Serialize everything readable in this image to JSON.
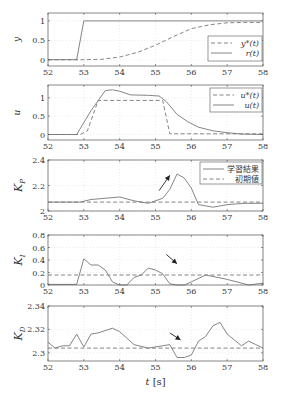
{
  "figure": {
    "xlabel": "t [s]",
    "x_ticks": [
      52,
      53,
      54,
      55,
      56,
      57,
      58
    ],
    "colors": {
      "line": "#777777",
      "axis": "#555555",
      "grid": "#d8d8d8",
      "text": "#333333"
    }
  },
  "chart_data": [
    {
      "type": "line",
      "ylabel": "y",
      "xlim": [
        52,
        58
      ],
      "ylim": [
        -0.15,
        1.2
      ],
      "yticks": [
        0,
        0.5,
        1
      ],
      "ytick_labels": [
        "0",
        "0.5",
        "1"
      ],
      "grid": true,
      "legend": {
        "position": "lower right",
        "entries": [
          "y*(t)",
          "r(t)"
        ]
      },
      "series": [
        {
          "name": "y*(t)",
          "style": "dashed",
          "x": [
            52,
            53,
            53.5,
            54,
            54.5,
            55,
            55.5,
            56,
            56.5,
            57,
            57.5,
            58
          ],
          "y": [
            0.01,
            0.01,
            0.02,
            0.08,
            0.2,
            0.38,
            0.6,
            0.8,
            0.9,
            0.95,
            0.96,
            0.96
          ]
        },
        {
          "name": "r(t)",
          "style": "solid",
          "x": [
            52,
            52.8,
            53,
            58
          ],
          "y": [
            0.01,
            0.01,
            1.0,
            1.0
          ]
        }
      ]
    },
    {
      "type": "line",
      "ylabel": "u",
      "xlim": [
        52,
        58
      ],
      "ylim": [
        -0.15,
        1.35
      ],
      "yticks": [
        0,
        0.5,
        1
      ],
      "ytick_labels": [
        "0",
        "0.5",
        "1"
      ],
      "grid": true,
      "legend": {
        "position": "upper right",
        "entries": [
          "u*(t)",
          "u(t)"
        ]
      },
      "series": [
        {
          "name": "u*(t)",
          "style": "dashed",
          "x": [
            52,
            52.9,
            53.1,
            53.4,
            55.2,
            55.4,
            58
          ],
          "y": [
            0,
            0,
            0.1,
            0.93,
            0.93,
            0.02,
            0.02
          ]
        },
        {
          "name": "u(t)",
          "style": "solid",
          "x": [
            52,
            52.8,
            53.2,
            53.6,
            53.8,
            54.0,
            54.3,
            54.8,
            55.1,
            55.3,
            55.6,
            55.9,
            56.2,
            56.6,
            57.0,
            57.4,
            58
          ],
          "y": [
            0,
            0,
            0.65,
            1.2,
            1.22,
            1.18,
            1.08,
            1.07,
            1.05,
            0.9,
            0.55,
            0.35,
            0.2,
            0.1,
            0.05,
            0.01,
            0.0
          ]
        }
      ]
    },
    {
      "type": "line",
      "ylabel": "KP",
      "xlim": [
        52,
        58
      ],
      "ylim": [
        2,
        2.4
      ],
      "yticks": [
        2,
        2.2,
        2.4
      ],
      "ytick_labels": [
        "2",
        "2.2",
        "2.4"
      ],
      "grid": true,
      "legend": {
        "position": "upper right",
        "entries": [
          "学習結果",
          "初期値"
        ]
      },
      "annotation": {
        "type": "arrow",
        "direction": "up-right",
        "x_from": 55.1,
        "y_from": 2.16,
        "x_to": 55.4,
        "y_to": 2.28
      },
      "series": [
        {
          "name": "学習結果",
          "style": "solid",
          "x": [
            52,
            52.9,
            53.2,
            54.0,
            54.4,
            54.8,
            55.2,
            55.4,
            55.6,
            55.8,
            56.0,
            56.2,
            56.6,
            57.0,
            57.5,
            58
          ],
          "y": [
            2.07,
            2.07,
            2.09,
            2.11,
            2.08,
            2.06,
            2.1,
            2.17,
            2.29,
            2.26,
            2.18,
            2.05,
            2.03,
            2.05,
            2.06,
            2.06
          ]
        },
        {
          "name": "初期値",
          "style": "dashed",
          "x": [
            52,
            58
          ],
          "y": [
            2.07,
            2.07
          ]
        }
      ]
    },
    {
      "type": "line",
      "ylabel": "KI",
      "xlim": [
        52,
        58
      ],
      "ylim": [
        0,
        0.8
      ],
      "yticks": [
        0,
        0.2,
        0.4,
        0.6,
        0.8
      ],
      "ytick_labels": [
        "0",
        "0.2",
        "0.4",
        "0.6",
        "0.8"
      ],
      "grid": true,
      "annotation": {
        "type": "arrow",
        "direction": "down-right",
        "x_from": 55.3,
        "y_from": 0.49,
        "x_to": 55.6,
        "y_to": 0.34
      },
      "series": [
        {
          "name": "学習結果",
          "style": "solid",
          "x": [
            52,
            52.8,
            53.0,
            53.2,
            53.4,
            53.6,
            53.8,
            54.0,
            54.2,
            54.4,
            54.6,
            54.8,
            55.0,
            55.2,
            55.4,
            55.6,
            55.8,
            56.0,
            56.4,
            57.0,
            57.6,
            58
          ],
          "y": [
            0.01,
            0.01,
            0.42,
            0.32,
            0.32,
            0.24,
            0.05,
            0.0,
            0.0,
            0.12,
            0.16,
            0.27,
            0.24,
            0.18,
            0.02,
            0.0,
            0.0,
            0.05,
            0.16,
            0.09,
            0.0,
            0.03
          ]
        },
        {
          "name": "初期値",
          "style": "dashed",
          "x": [
            52,
            58
          ],
          "y": [
            0.16,
            0.16
          ]
        }
      ]
    },
    {
      "type": "line",
      "ylabel": "KD",
      "xlabel": "t [s]",
      "xlim": [
        52,
        58
      ],
      "ylim": [
        2.293,
        2.34
      ],
      "yticks": [
        2.3,
        2.32,
        2.34
      ],
      "ytick_labels": [
        "2.3",
        "2.32",
        "2.34"
      ],
      "grid": true,
      "annotation": {
        "type": "arrow",
        "direction": "down-right",
        "x_from": 55.4,
        "y_from": 2.317,
        "x_to": 55.7,
        "y_to": 2.311
      },
      "series": [
        {
          "name": "学習結果",
          "style": "solid",
          "x": [
            52,
            52.2,
            52.4,
            52.6,
            52.8,
            53.0,
            53.2,
            53.4,
            53.8,
            54.0,
            54.4,
            54.8,
            55.2,
            55.4,
            55.6,
            55.8,
            56.0,
            56.2,
            56.4,
            56.6,
            56.8,
            57.0,
            57.2,
            57.4,
            57.6,
            57.8,
            58
          ],
          "y": [
            2.309,
            2.304,
            2.306,
            2.306,
            2.316,
            2.305,
            2.316,
            2.317,
            2.321,
            2.318,
            2.307,
            2.304,
            2.306,
            2.307,
            2.296,
            2.296,
            2.298,
            2.31,
            2.314,
            2.323,
            2.326,
            2.316,
            2.311,
            2.306,
            2.31,
            2.307,
            2.304
          ]
        },
        {
          "name": "初期値",
          "style": "dashed",
          "x": [
            52,
            58
          ],
          "y": [
            2.304,
            2.304
          ]
        }
      ]
    }
  ]
}
